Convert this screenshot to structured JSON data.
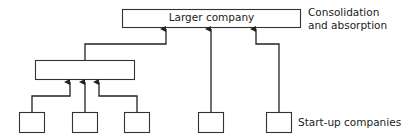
{
  "diagram": {
    "top_box": {
      "label": "Larger company"
    },
    "middle_box": {
      "label": ""
    },
    "annotations": {
      "consolidation_line1": "Consolidation",
      "consolidation_line2": "and absorption",
      "startups": "Start-up companies"
    },
    "startup_boxes": [
      {
        "id": "s1"
      },
      {
        "id": "s2"
      },
      {
        "id": "s3"
      },
      {
        "id": "s4"
      },
      {
        "id": "s5"
      }
    ],
    "colors": {
      "stroke": "#333333",
      "box_fill": "#ffffff"
    }
  }
}
